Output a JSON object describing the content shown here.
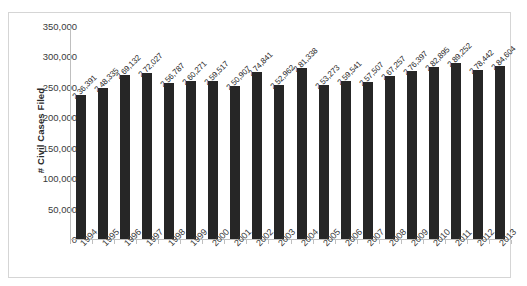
{
  "chart_data": {
    "type": "bar",
    "title": "",
    "subtitle": "",
    "xlabel": "",
    "ylabel": "# Civil Cases Filed",
    "ylim": [
      0,
      350000
    ],
    "ytick_step": 50000,
    "ytick_labels": [
      "350,000",
      "300,000",
      "250,000",
      "200,000",
      "150,000",
      "100,000",
      "50,000",
      "0"
    ],
    "ytick_values": [
      350000,
      300000,
      250000,
      200000,
      150000,
      100000,
      50000,
      0
    ],
    "grid": false,
    "legend": false,
    "legend_position": "none",
    "bar_color": "#262626",
    "categories": [
      "1994",
      "1995",
      "1996",
      "1997",
      "1998",
      "1999",
      "2000",
      "2001",
      "2002",
      "2003",
      "2004",
      "2005",
      "2006",
      "2007",
      "2008",
      "2009",
      "2010",
      "2011",
      "2012",
      "2013"
    ],
    "values": [
      236391,
      248335,
      269132,
      272027,
      256787,
      260271,
      259517,
      250907,
      274841,
      252962,
      281338,
      253273,
      259541,
      257507,
      267257,
      276397,
      282895,
      289252,
      278442,
      284604
    ],
    "data_labels": [
      "2,36,391",
      "2,48,335",
      "2,69,132",
      "2,72,027",
      "2,56,787",
      "2,60,271",
      "2,59,517",
      "2,50,907",
      "2,74,841",
      "2,52,962",
      "2,81,338",
      "2,53,273",
      "2,59,541",
      "2,57,507",
      "2,67,257",
      "2,76,397",
      "2,82,895",
      "2,89,252",
      "2,78,442",
      "2,84,604"
    ]
  }
}
